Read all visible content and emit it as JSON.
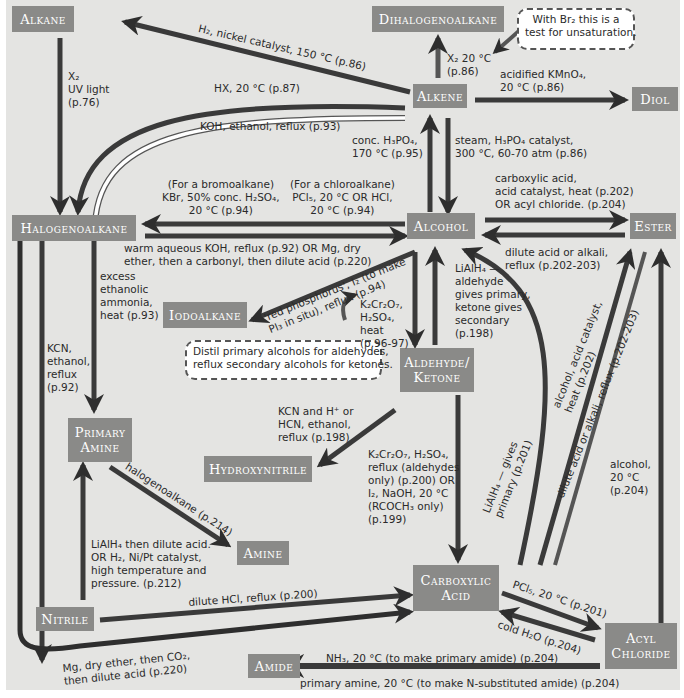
{
  "colors": {
    "background": "#e4e4e2",
    "box_fill": "#8a8a88",
    "box_text": "#ffffff",
    "arrow_dark": "#2e2e2e",
    "arrow_light": "#ffffff"
  },
  "nodes": {
    "alkane": "Alkane",
    "dihalogenoalkane": "Dihalogenoalkane",
    "alkene": "Alkene",
    "diol": "Diol",
    "halogenoalkane": "Halogenoalkane",
    "alcohol": "Alcohol",
    "ester": "Ester",
    "iodoalkane": "Iodoalkane",
    "aldehyde_ketone_1": "Aldehyde/",
    "aldehyde_ketone_2": "Ketone",
    "primary_amine_1": "Primary",
    "primary_amine_2": "Amine",
    "hydroxynitrile": "Hydroxynitrile",
    "amine": "Amine",
    "carboxylic_acid_1": "Carboxylic",
    "carboxylic_acid_2": "Acid",
    "nitrile": "Nitrile",
    "acyl_chloride_1": "Acyl",
    "acyl_chloride_2": "Chloride",
    "amide": "Amide"
  },
  "callouts": {
    "bromine_test": "With Br₂ this is a\ntest for unsaturation.",
    "distil_note": "Distil primary alcohols for aldehydes,\nreflux secondary alcohols for ketones."
  },
  "labels": {
    "h2_nickel": "H₂, nickel catalyst, 150 °C (p.86)",
    "x2_uv": "X₂\nUV light\n(p.76)",
    "hx": "HX, 20 °C (p.87)",
    "koh_ethanol": "KOH, ethanol, reflux (p.93)",
    "x2_20": "X₂ 20 °C\n(p.86)",
    "kmno4": "acidified KMnO₄,\n20 °C (p.86)",
    "conc_h3po4": "conc. H₃PO₄,\n170 °C (p.95)",
    "steam": "steam, H₃PO₄ catalyst,\n300 °C, 60-70 atm (p.86)",
    "bromoalkane": "(For a bromoalkane)\nKBr, 50% conc. H₂SO₄,\n20 °C (p.94)",
    "chloroalkane": "(For a chloroalkane)\nPCl₅, 20 °C OR HCl,\n20 °C (p.94)",
    "carboxylic_ester": "carboxylic acid,\nacid catalyst, heat (p.202)\nOR acyl chloride. (p.204)",
    "warm_koh": "warm aqueous KOH, reflux (p.92) OR Mg, dry\nether, then a carbonyl, then dilute acid (p.220)",
    "dilute_acid_alkali": "dilute acid or alkali,\nreflux (p.202-203)",
    "excess_ammonia": "excess\nethanolic\nammonia,\nheat (p.93)",
    "red_phosphorus": "'red phosphorus', I₂ (to make\nPI₃ in situ), reflux (p.94)",
    "lialh4_aldehyde": "LiAlH₄ —\naldehyde\ngives primary,\nketone gives\nsecondary\n(p.198)",
    "k2cr2o7": "K₂Cr₂O₇,\nH₂SO₄,\nheat\n(p.96-97)",
    "kcn_ethanol": "KCN,\nethanol,\nreflux\n(p.92)",
    "kcn_hcn": "KCN and H⁺ or\nHCN, ethanol,\nreflux (p.198)",
    "k2cr2o7_oxidation": "K₂Cr₂O₇, H₂SO₄,\nreflux (aldehydes\nonly) (p.200) OR\nI₂, NaOH, 20 °C\n(RCOCH₃ only)\n(p.199)",
    "lialh4_primary": "LiAlH₄ — gives\nprimary (p.201)",
    "alcohol_acid_catalyst": "alcohol, acid catalyst,\nheat (p.202)",
    "dilute_acid_reflux": "dilute acid or alkali, reflux (p.202-203)",
    "alcohol_20": "alcohol,\n20 °C\n(p.204)",
    "halogenoalkane_214": "halogenoalkane (p.214)",
    "lialh4_nitrile": "LiAlH₄ then dilute acid.\nOR H₂, Ni/Pt catalyst,\nhigh temperature and\npressure. (p.212)",
    "dilute_hcl": "dilute HCl, reflux (p.200)",
    "pcl5": "PCl₅, 20 °C (p.201)",
    "cold_water": "cold H₂O (p.204)",
    "mg_co2": "Mg, dry ether, then CO₂,\nthen dilute acid (p.220)",
    "nh3_amide": "NH₃, 20 °C (to make primary amide) (p.204)",
    "primary_amine_amide": "primary amine, 20 °C (to make N-substituted amide) (p.204)"
  }
}
